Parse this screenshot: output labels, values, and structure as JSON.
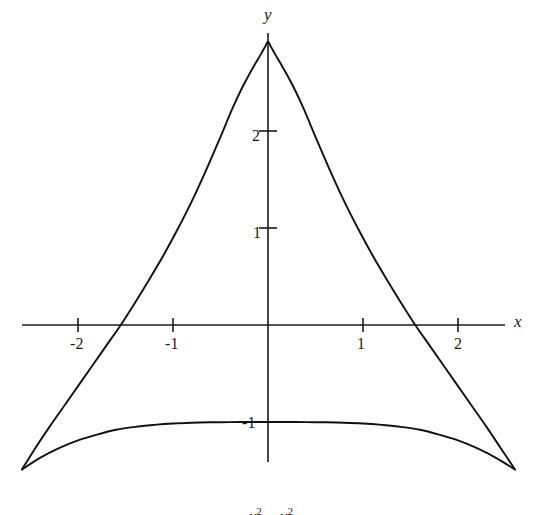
{
  "figure": {
    "background_color": "#ffffff",
    "ink_color": "#111111"
  },
  "axes": {
    "x_label": "x",
    "y_label": "y",
    "x_ticks": [
      {
        "label": "-2",
        "value": -2
      },
      {
        "label": "-1",
        "value": -1
      },
      {
        "label": "1",
        "value": 1
      },
      {
        "label": "2",
        "value": 2
      }
    ],
    "y_ticks": [
      {
        "label": "2",
        "value": 2
      },
      {
        "label": "1",
        "value": 1
      },
      {
        "label": "-1",
        "value": -1
      }
    ]
  },
  "caption": {
    "text_partial": "x² − y²",
    "visible": "clipped"
  },
  "chart_data": {
    "type": "line",
    "title": "",
    "xlabel": "x",
    "ylabel": "y",
    "grid": false,
    "legend": null,
    "xlim": [
      -2.8,
      2.8
    ],
    "ylim": [
      -1.8,
      3.1
    ],
    "xticks": [
      -2,
      -1,
      1,
      2
    ],
    "yticks": [
      -1,
      1,
      2
    ],
    "annotations": [
      {
        "text": "cusp at top of upper branch",
        "x": 0.0,
        "y": 2.92
      },
      {
        "text": "upper branch crosses x-axis",
        "x": -1.19,
        "y": 0
      },
      {
        "text": "upper branch crosses x-axis",
        "x": 1.15,
        "y": 0
      },
      {
        "text": "lower branch maximum",
        "x": 0.0,
        "y": -1.0
      },
      {
        "text": "branches meet at left endpoint",
        "x": -2.59,
        "y": -1.49
      },
      {
        "text": "branches meet at right endpoint",
        "x": 2.6,
        "y": -1.49
      }
    ],
    "series": [
      {
        "name": "upper branch",
        "x": [
          -2.59,
          -2.45,
          -2.3,
          -2.15,
          -2.0,
          -1.85,
          -1.7,
          -1.55,
          -1.4,
          -1.25,
          -1.1,
          -0.95,
          -0.8,
          -0.65,
          -0.5,
          -0.38,
          -0.28,
          -0.2,
          -0.13,
          -0.07,
          -0.03,
          0.0,
          0.03,
          0.07,
          0.13,
          0.2,
          0.28,
          0.38,
          0.5,
          0.65,
          0.8,
          0.95,
          1.1,
          1.25,
          1.4,
          1.55,
          1.7,
          1.85,
          2.0,
          2.15,
          2.3,
          2.45,
          2.6
        ],
        "y": [
          -1.49,
          -1.27,
          -1.05,
          -0.84,
          -0.63,
          -0.42,
          -0.21,
          0.0,
          0.23,
          0.47,
          0.72,
          0.99,
          1.28,
          1.6,
          1.94,
          2.22,
          2.43,
          2.58,
          2.7,
          2.8,
          2.87,
          2.92,
          2.87,
          2.8,
          2.7,
          2.58,
          2.43,
          2.22,
          1.94,
          1.6,
          1.28,
          0.99,
          0.72,
          0.47,
          0.23,
          0.0,
          -0.21,
          -0.42,
          -0.63,
          -0.84,
          -1.05,
          -1.27,
          -1.49
        ]
      },
      {
        "name": "lower branch",
        "x": [
          -2.59,
          -2.4,
          -2.2,
          -2.0,
          -1.8,
          -1.6,
          -1.4,
          -1.2,
          -1.0,
          -0.8,
          -0.6,
          -0.4,
          -0.2,
          0.0,
          0.2,
          0.4,
          0.6,
          0.8,
          1.0,
          1.2,
          1.4,
          1.6,
          1.8,
          2.0,
          2.2,
          2.4,
          2.6
        ],
        "y": [
          -1.49,
          -1.37,
          -1.27,
          -1.19,
          -1.13,
          -1.08,
          -1.05,
          -1.03,
          -1.015,
          -1.007,
          -1.003,
          -1.001,
          -1.0,
          -1.0,
          -1.0,
          -1.001,
          -1.003,
          -1.007,
          -1.015,
          -1.03,
          -1.05,
          -1.08,
          -1.13,
          -1.19,
          -1.27,
          -1.37,
          -1.49
        ]
      }
    ]
  }
}
